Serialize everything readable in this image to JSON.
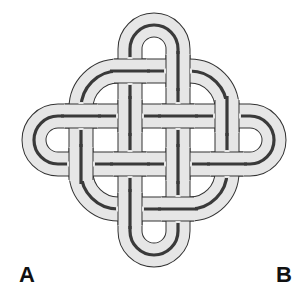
{
  "figure": {
    "colors": {
      "band_fill": "#e6e6e6",
      "band_outline": "#333333",
      "center_line": "#3a3a3a",
      "background": "#ffffff"
    }
  },
  "labels": {
    "a": "A",
    "b": "B"
  }
}
